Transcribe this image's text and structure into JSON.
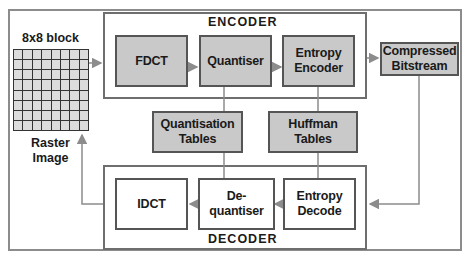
{
  "diagram": {
    "encoder": {
      "label": "ENCODER",
      "blocks": [
        {
          "id": "fdct",
          "label": "FDCT"
        },
        {
          "id": "quantiser",
          "label": "Quantiser"
        },
        {
          "id": "entropy_encoder",
          "label": "Entropy Encoder"
        }
      ]
    },
    "decoder": {
      "label": "DECODER",
      "blocks": [
        {
          "id": "idct",
          "label": "IDCT"
        },
        {
          "id": "dequantiser",
          "label": "De-quantiser"
        },
        {
          "id": "entropy_decode",
          "label": "Entropy Decode"
        }
      ]
    },
    "tables": [
      {
        "id": "quantisation_tables",
        "label": "Quantisation Tables"
      },
      {
        "id": "huffman_tables",
        "label": "Huffman Tables"
      }
    ],
    "bitstream": {
      "label": "Compressed Bitstream"
    },
    "source": {
      "top_label": "8x8 block",
      "bottom_label": "Raster Image",
      "grid_rows": 8,
      "grid_cols": 8
    },
    "edges": [
      {
        "from": "source",
        "to": "fdct"
      },
      {
        "from": "fdct",
        "to": "quantiser"
      },
      {
        "from": "quantiser",
        "to": "entropy_encoder"
      },
      {
        "from": "entropy_encoder",
        "to": "bitstream"
      },
      {
        "from": "bitstream",
        "to": "entropy_decode"
      },
      {
        "from": "entropy_decode",
        "to": "dequantiser"
      },
      {
        "from": "dequantiser",
        "to": "idct"
      },
      {
        "from": "idct",
        "to": "source"
      },
      {
        "from": "quantisation_tables",
        "to": "quantiser",
        "type": "line"
      },
      {
        "from": "quantisation_tables",
        "to": "dequantiser",
        "type": "line"
      },
      {
        "from": "huffman_tables",
        "to": "entropy_encoder",
        "type": "line"
      },
      {
        "from": "huffman_tables",
        "to": "entropy_decode",
        "type": "line"
      }
    ],
    "colors": {
      "shaded_fill": "#c9c9c9",
      "line": "#8c8c8c",
      "border": "#555555"
    }
  }
}
